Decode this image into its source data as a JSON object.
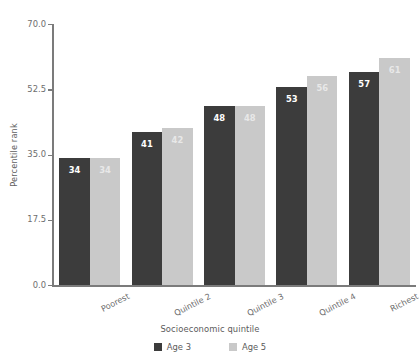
{
  "chart_data": {
    "type": "bar",
    "title": "",
    "xlabel": "Socioeconomic quintile",
    "ylabel": "Percentile rank",
    "categories": [
      "Poorest",
      "Quintile 2",
      "Quintile 3",
      "Quintile 4",
      "Richest"
    ],
    "series": [
      {
        "name": "Age 3",
        "color": "#3c3c3c",
        "values": [
          34,
          41,
          48,
          53,
          57
        ]
      },
      {
        "name": "Age 5",
        "color": "#c9c9c9",
        "values": [
          34,
          42,
          48,
          56,
          61
        ]
      }
    ],
    "ylim": [
      0,
      70
    ],
    "yticks": [
      0.0,
      17.5,
      35.0,
      52.5,
      70.0
    ],
    "ytick_labels": [
      "0.0",
      "17.5",
      "35.0",
      "52.5",
      "70.0"
    ],
    "grid": false,
    "legend_position": "bottom",
    "data_labels": true
  }
}
